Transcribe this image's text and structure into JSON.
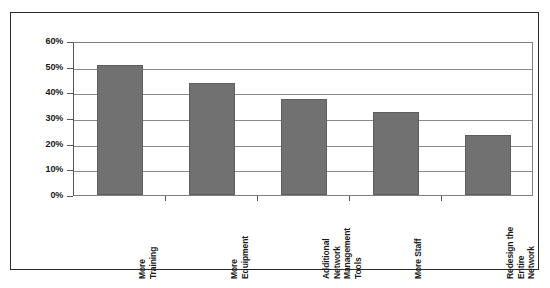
{
  "chart_data": {
    "type": "bar",
    "title": "",
    "subtitle": "",
    "xlabel": "",
    "ylabel": "",
    "categories": [
      "More Training",
      "More Equipment",
      "Additional Network Management Tools",
      "More Staff",
      "Redesign the Entire Network"
    ],
    "category_lines": [
      [
        "More",
        "Training"
      ],
      [
        "More",
        "Equipment"
      ],
      [
        "Additional",
        "Network",
        "Management",
        "Tools"
      ],
      [
        "More Staff"
      ],
      [
        "Redesign the",
        "Entire",
        "Network"
      ]
    ],
    "values": [
      50.5,
      43.5,
      37.5,
      32.5,
      23.5
    ],
    "value_unit": "%",
    "ylim": [
      0,
      60
    ],
    "ytick_values": [
      0,
      10,
      20,
      30,
      40,
      50,
      60
    ],
    "ytick_labels": [
      "0%",
      "10%",
      "20%",
      "30%",
      "40%",
      "50%",
      "60%"
    ],
    "grid": true,
    "grid_axis": "y",
    "legend": false,
    "legend_position": "none",
    "orientation": "vertical",
    "bar_color": "#717171",
    "bar_border_color": "#5e5e5e",
    "gridline_color": "#8a8a8a",
    "axis_color": "#555555",
    "frame_color": "#2b2b2b",
    "background_color": "#ffffff",
    "text_color": "#1a1a1a"
  }
}
